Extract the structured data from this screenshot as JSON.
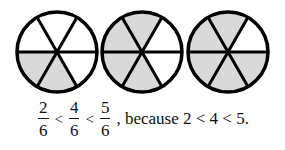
{
  "diagram": {
    "type": "fraction-circles",
    "shade_color": "#d9d9d9",
    "stroke_color": "#000000",
    "circles": [
      {
        "numerator": 2,
        "denominator": 6,
        "cx": 57,
        "cy": 52,
        "r": 40,
        "shaded_sectors": [
          3,
          4
        ]
      },
      {
        "numerator": 4,
        "denominator": 6,
        "cx": 142,
        "cy": 52,
        "r": 40,
        "shaded_sectors": [
          1,
          2,
          3,
          4
        ]
      },
      {
        "numerator": 5,
        "denominator": 6,
        "cx": 228,
        "cy": 52,
        "r": 40,
        "shaded_sectors": [
          1,
          2,
          3,
          4,
          5
        ]
      }
    ]
  },
  "equation": {
    "fractions": [
      {
        "num": "2",
        "den": "6"
      },
      {
        "num": "4",
        "den": "6"
      },
      {
        "num": "5",
        "den": "6"
      }
    ],
    "operators": [
      "<",
      "<"
    ],
    "tail": ", because 2 < 4 < 5."
  }
}
